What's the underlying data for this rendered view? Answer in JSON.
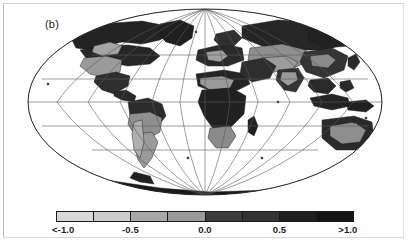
{
  "figure": {
    "panel_label": "(b)",
    "background_color": "#ffffff",
    "frame_color": "#b9b9b9"
  },
  "chart_data": {
    "type": "heatmap",
    "title": "(b)",
    "subtitle": "",
    "xlabel": "",
    "ylabel": "",
    "projection": "Mollweide",
    "grid": true,
    "legend_position": "bottom",
    "colorbar": {
      "orientation": "horizontal",
      "tick_labels": [
        "<-1.0",
        "-0.5",
        "0.0",
        "0.5",
        ">1.0"
      ],
      "tick_values": [
        -1.0,
        -0.5,
        0.0,
        0.5,
        1.0
      ],
      "tick_positions_pct": [
        0,
        25,
        50,
        75,
        100
      ],
      "vmin": -1.0,
      "vmax": 1.0,
      "extend": "both",
      "n_segments": 8,
      "segment_bounds": [
        -1.0,
        -0.75,
        -0.5,
        -0.25,
        0.0,
        0.25,
        0.5,
        0.75,
        1.0
      ],
      "segment_colors": [
        "#d8d8d8",
        "#cccccc",
        "#a8a8a8",
        "#9a9a9a",
        "#3c3c3c",
        "#343434",
        "#1f1f1f",
        "#141414"
      ],
      "segment_labels": [
        "<-1.0 to -0.75",
        "-0.75 to -0.5",
        "-0.5 to -0.25",
        "-0.25 to 0.0",
        "0.0 to 0.25",
        "0.25 to 0.5",
        "0.5 to 0.75",
        "0.75 to >1.0"
      ]
    },
    "graticule": {
      "parallels": [
        -60,
        -30,
        0,
        30,
        60
      ],
      "meridians": [
        -180,
        -150,
        -120,
        -90,
        -60,
        -30,
        0,
        30,
        60,
        90,
        120,
        150,
        180
      ],
      "line_color": "#5a5a5a"
    },
    "ocean_color": "#ffffff",
    "outline_color": "#1a1a1a",
    "regions": [
      {
        "name": "north-america-arctic",
        "value": 0.85,
        "shade": "#232323"
      },
      {
        "name": "north-america-interior",
        "value": -0.35,
        "shade": "#9a9a9a"
      },
      {
        "name": "greenland",
        "value": 0.9,
        "shade": "#1f1f1f"
      },
      {
        "name": "south-america-north",
        "value": 0.7,
        "shade": "#2c2c2c"
      },
      {
        "name": "south-america-south",
        "value": -0.4,
        "shade": "#9a9a9a"
      },
      {
        "name": "africa",
        "value": 0.9,
        "shade": "#202020"
      },
      {
        "name": "africa-sahel",
        "value": -0.3,
        "shade": "#9a9a9a"
      },
      {
        "name": "europe",
        "value": 0.8,
        "shade": "#2a2a2a"
      },
      {
        "name": "central-asia",
        "value": -0.3,
        "shade": "#8f8f8f"
      },
      {
        "name": "siberia",
        "value": 0.8,
        "shade": "#262626"
      },
      {
        "name": "east-asia",
        "value": 0.6,
        "shade": "#343434"
      },
      {
        "name": "australia",
        "value": 0.75,
        "shade": "#2a2a2a"
      },
      {
        "name": "antarctica",
        "value": 0.9,
        "shade": "#1a1a1a"
      }
    ]
  }
}
